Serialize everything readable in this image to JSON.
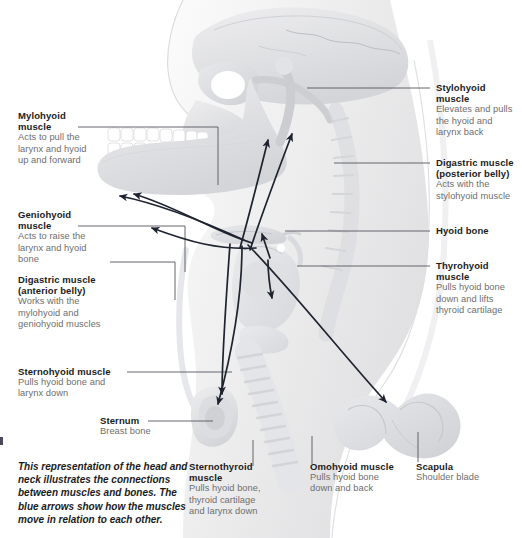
{
  "figure": {
    "caption": "This representation of the head and neck illustrates the connections between muscles and bones. The blue arrows show how the muscles move in relation to each other.",
    "arrow_color": "#1e2330",
    "leader_color": "#55555f",
    "heading_color": "#1b1b1b",
    "body_color": "#6e6e6e",
    "background": "#ffffff",
    "bone_fill": "#e3e4e6",
    "soft_tissue_fill": "#f2f2f3"
  },
  "labels": {
    "mylohyoid": {
      "heading": "Mylohyoid muscle",
      "heading_line1": "Mylohyoid",
      "heading_line2": "muscle",
      "description": "Acts to pull the larynx and hyoid up and forward"
    },
    "geniohyoid": {
      "heading": "Geniohyoid muscle",
      "heading_line1": "Geniohyoid",
      "heading_line2": "muscle",
      "description": "Acts to raise the larynx and hyoid bone"
    },
    "digastric_anterior": {
      "heading_line1": "Digastric muscle",
      "heading_line2": "(anterior belly)",
      "description": "Works with the mylohyoid and geniohyoid muscles"
    },
    "sternohyoid": {
      "heading": "Sternohyoid muscle",
      "description": "Pulls hyoid bone and larynx down"
    },
    "sternum": {
      "heading": "Sternum",
      "description": "Breast bone"
    },
    "sternothyroid": {
      "heading_line1": "Sternothyroid",
      "heading_line2": "muscle",
      "description": "Pulls hyoid bone, thyroid cartilage and larynx down"
    },
    "omohyoid": {
      "heading": "Omohyoid muscle",
      "description": "Pulls hyoid bone down and back"
    },
    "scapula": {
      "heading": "Scapula",
      "description": "Shoulder blade"
    },
    "stylohyoid": {
      "heading": "Stylohyoid muscle",
      "description": "Elevates and pulls the hyoid and larynx back"
    },
    "digastric_posterior": {
      "heading_line1": "Digastric muscle",
      "heading_line2": "(posterior belly)",
      "description": "Acts with the stylohyoid muscle"
    },
    "hyoid_bone": {
      "heading": "Hyoid bone",
      "description": ""
    },
    "thyrohyoid": {
      "heading_line1": "Thyrohyoid",
      "heading_line2": "muscle",
      "description": "Pulls hyoid bone down and lifts thyroid cartilage"
    }
  }
}
